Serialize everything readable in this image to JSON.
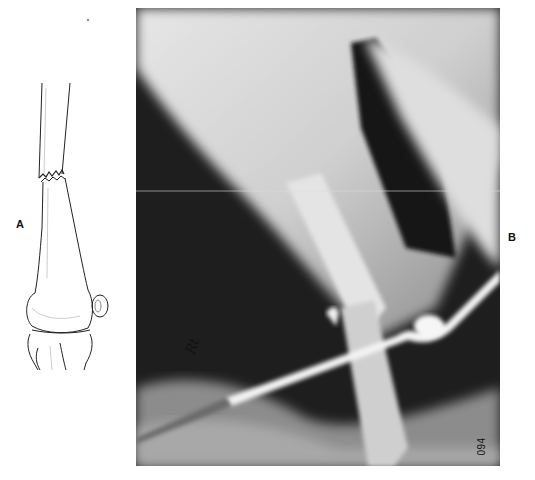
{
  "figure": {
    "panels": [
      {
        "label": "A",
        "type": "line-drawing",
        "subject": "fractured femur shaft with knee joint and patella"
      },
      {
        "label": "B",
        "type": "radiograph",
        "subject": "femoral shaft fracture with intramedullary pin and joint"
      }
    ],
    "xray": {
      "film_number": "094",
      "marker_text": "Rt",
      "colors": {
        "background_dark": "#1a1a1a",
        "soft_tissue": "#d9d9d9",
        "bone": "#e8e8e8",
        "metal": "#f2f2f2"
      }
    }
  }
}
